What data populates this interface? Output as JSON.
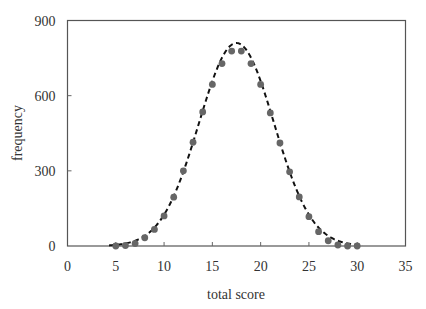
{
  "chart_data": {
    "type": "scatter",
    "title": "",
    "xlabel": "total score",
    "ylabel": "frequency",
    "xlim": [
      0,
      35
    ],
    "ylim": [
      0,
      900
    ],
    "xticks": [
      0,
      5,
      10,
      15,
      20,
      25,
      30,
      35
    ],
    "yticks": [
      0,
      300,
      600,
      900
    ],
    "grid": false,
    "legend": "none",
    "series": [
      {
        "name": "observed",
        "style": "markers",
        "color": "#666666",
        "x": [
          5,
          6,
          7,
          8,
          9,
          10,
          11,
          12,
          13,
          14,
          15,
          16,
          17,
          18,
          19,
          20,
          21,
          22,
          23,
          24,
          25,
          26,
          27,
          28,
          29,
          30
        ],
        "y": [
          0,
          2,
          10,
          33,
          66,
          120,
          195,
          300,
          414,
          535,
          645,
          728,
          778,
          778,
          728,
          645,
          531,
          411,
          296,
          196,
          117,
          57,
          21,
          4,
          0,
          0
        ]
      },
      {
        "name": "normal fit",
        "style": "dashed-line",
        "color": "#111111",
        "mean": 17.5,
        "sd": 3.88,
        "peak": 810
      }
    ]
  }
}
